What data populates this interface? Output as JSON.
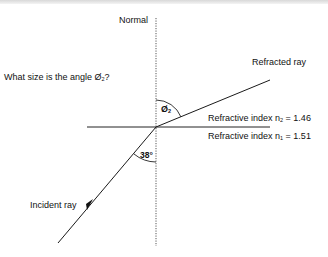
{
  "diagram": {
    "question": "What size is the angle Ø",
    "question_sub": "2",
    "question_end": "?",
    "normal_label": "Normal",
    "refracted_label": "Refracted ray",
    "incident_label": "Incident ray",
    "angle1_label": "38°",
    "angle2_symbol": "Ø",
    "angle2_sub": "2",
    "medium2": {
      "prefix": "Refractive index n",
      "sub": "2",
      "suffix": " = 1.46"
    },
    "medium1": {
      "prefix": "Refractive index n",
      "sub": "1",
      "suffix": " = 1.51"
    },
    "colors": {
      "line": "#1a1a1a",
      "text": "#111111"
    }
  }
}
